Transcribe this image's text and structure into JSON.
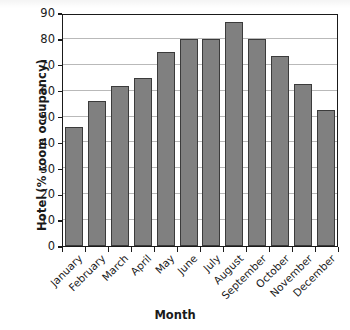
{
  "chart_data": {
    "type": "bar",
    "title": "",
    "xlabel": "Month",
    "ylabel": "Hotel (% room occupancy)",
    "ylabel_lines": [
      "Hotel",
      "(% room occupancy)"
    ],
    "categories": [
      "January",
      "February",
      "March",
      "April",
      "May",
      "June",
      "July",
      "August",
      "September",
      "October",
      "November",
      "December"
    ],
    "values": [
      46,
      56,
      62,
      65,
      75,
      80,
      80,
      86.5,
      80,
      73.5,
      62.5,
      52.5
    ],
    "ylim": [
      0,
      90
    ],
    "ytick_step": 10,
    "yticks": [
      0,
      10,
      20,
      30,
      40,
      50,
      60,
      70,
      80,
      90
    ],
    "ytick_labels": [
      "0",
      "10",
      "20",
      "30",
      "40",
      "50",
      "60",
      "70",
      "80",
      "90"
    ],
    "grid": true,
    "grid_axis": "y",
    "legend": false,
    "legend_position": "none",
    "bar_color": "#808080",
    "bar_edge_color": "#3b3b3b",
    "grid_color": "#b9b9b9",
    "axis_color": "#1a1a1a",
    "xtick_label_rotation": -45
  }
}
